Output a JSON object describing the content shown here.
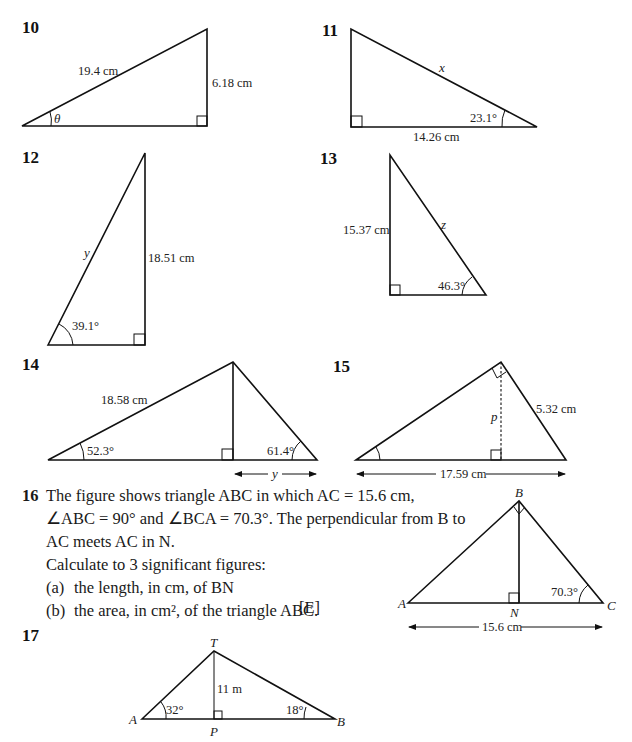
{
  "questions": {
    "q10": {
      "number": "10",
      "hypotenuse": "19.4 cm",
      "opposite": "6.18 cm",
      "angle": "θ"
    },
    "q11": {
      "number": "11",
      "hypotenuse": "x",
      "adjacent": "14.26 cm",
      "angle": "23.1°"
    },
    "q12": {
      "number": "12",
      "hypotenuse": "y",
      "opposite": "18.51 cm",
      "angle": "39.1°"
    },
    "q13": {
      "number": "13",
      "hypotenuse": "z",
      "opposite": "15.37 cm",
      "angle": "46.3°"
    },
    "q14": {
      "number": "14",
      "side": "18.58 cm",
      "angle_left": "52.3°",
      "angle_right": "61.4°",
      "unknown": "y"
    },
    "q15": {
      "number": "15",
      "height": "p",
      "side": "5.32 cm",
      "base": "17.59 cm"
    },
    "q16": {
      "number": "16",
      "text_lines": [
        "The figure shows triangle ABC in which AC = 15.6 cm,",
        "∠ABC = 90° and ∠BCA = 70.3°. The perpendicular from B to",
        "AC meets AC in N.",
        "Calculate to 3 significant figures:"
      ],
      "parts": [
        {
          "label": "(a)",
          "text": "the length, in cm, of BN"
        },
        {
          "label": "(b)",
          "text": "the area, in cm², of the triangle ABC."
        }
      ],
      "source": "[E]",
      "figure": {
        "A": "A",
        "B": "B",
        "C": "C",
        "N": "N",
        "angle": "70.3°",
        "base": "15.6 cm"
      }
    },
    "q17": {
      "number": "17",
      "T": "T",
      "A": "A",
      "B": "B",
      "P": "P",
      "height": "11 m",
      "angle_A": "32°",
      "angle_B": "18°"
    }
  }
}
